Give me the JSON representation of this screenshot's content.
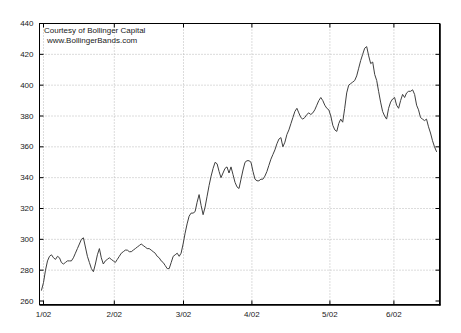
{
  "window": {
    "width": 461,
    "height": 333,
    "background": "#ffffff"
  },
  "chart_data": {
    "type": "line",
    "title": "",
    "xlabel": "",
    "ylabel": "",
    "annotation": {
      "line1": "Courtesy of Bollinger Capital",
      "line2": "www.BollingerBands.com",
      "position": "top-left"
    },
    "x_tick_labels": [
      "1/02",
      "2/02",
      "3/02",
      "4/02",
      "5/02",
      "6/02"
    ],
    "x_tick_fractions": [
      0.01,
      0.187,
      0.36,
      0.531,
      0.726,
      0.886
    ],
    "y_ticks": [
      260,
      280,
      300,
      320,
      340,
      360,
      380,
      400,
      420,
      440
    ],
    "ylim": [
      260,
      440
    ],
    "grid": true,
    "grid_style": "dotted",
    "legend_position": "none",
    "colors": {
      "line": "#3f3f3f",
      "grid": "#b8b8b8",
      "frame": "#000000",
      "text": "#1a1a1a",
      "background": "#ffffff"
    },
    "series": [
      {
        "name": "price",
        "x_unit": "fraction_of_plot_width",
        "x_start_fraction": 0.005,
        "x_end_fraction": 0.9925,
        "values": [
          267,
          272,
          280,
          286,
          289,
          290,
          288,
          287,
          289,
          288,
          285,
          284,
          285,
          286,
          286,
          286,
          288,
          291,
          294,
          297,
          300,
          301,
          295,
          289,
          285,
          281,
          279,
          284,
          290,
          294,
          288,
          284,
          286,
          287,
          288,
          287,
          286,
          285,
          287,
          289,
          291,
          292,
          293,
          293,
          292,
          292,
          293,
          294,
          295,
          296,
          297,
          296,
          295,
          294,
          294,
          293,
          292,
          291,
          289,
          288,
          286,
          285,
          283,
          281,
          281,
          285,
          289,
          290,
          291,
          289,
          291,
          297,
          304,
          310,
          315,
          317,
          317,
          318,
          324,
          329,
          322,
          316,
          321,
          328,
          335,
          341,
          346,
          350,
          349,
          344,
          340,
          343,
          346,
          347,
          343,
          347,
          342,
          337,
          334,
          333,
          339,
          345,
          350,
          351,
          351,
          350,
          344,
          339,
          338,
          338,
          339,
          339,
          341,
          344,
          348,
          352,
          355,
          358,
          362,
          365,
          366,
          360,
          363,
          368,
          371,
          375,
          379,
          383,
          385,
          382,
          379,
          378,
          379,
          381,
          382,
          381,
          382,
          384,
          387,
          390,
          392,
          390,
          387,
          385,
          384,
          380,
          374,
          371,
          370,
          375,
          378,
          376,
          385,
          395,
          400,
          401,
          402,
          403,
          406,
          411,
          416,
          420,
          424,
          425,
          419,
          414,
          415,
          407,
          403,
          396,
          389,
          383,
          380,
          378,
          385,
          389,
          391,
          392,
          387,
          385,
          390,
          394,
          392,
          395,
          396,
          396,
          397,
          394,
          387,
          384,
          379,
          378,
          377,
          378,
          373,
          369,
          364,
          360,
          357
        ]
      }
    ]
  }
}
